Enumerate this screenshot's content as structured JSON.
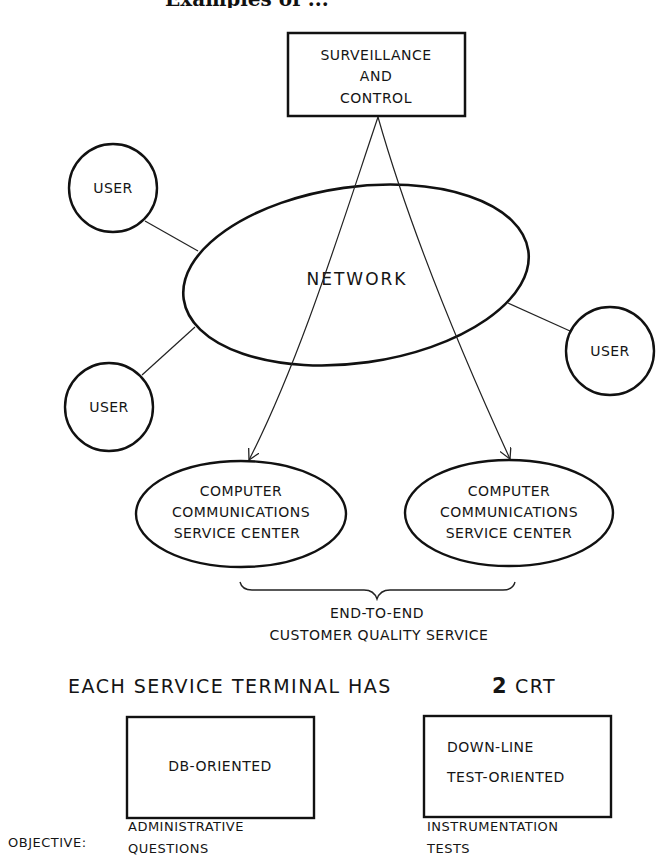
{
  "header": {
    "cut_off_title": "Examples of ..."
  },
  "diagram": {
    "surveillance_box": {
      "lines": [
        "SURVEILLANCE",
        "AND",
        "CONTROL"
      ]
    },
    "network": {
      "label": "NETWORK"
    },
    "users": [
      {
        "label": "USER",
        "position": "upper-left"
      },
      {
        "label": "USER",
        "position": "lower-left"
      },
      {
        "label": "USER",
        "position": "right"
      }
    ],
    "service_centers": [
      {
        "lines": [
          "COMPUTER",
          "COMMUNICATIONS",
          "SERVICE CENTER"
        ]
      },
      {
        "lines": [
          "COMPUTER",
          "COMMUNICATIONS",
          "SERVICE CENTER"
        ]
      }
    ],
    "brace_caption": {
      "lines": [
        "END-TO-END",
        "CUSTOMER QUALITY SERVICE"
      ]
    }
  },
  "terminal": {
    "heading": {
      "prefix": "EACH SERVICE TERMINAL HAS",
      "count": "2",
      "suffix": "CRT"
    },
    "crts": [
      {
        "lines": [
          "DB-ORIENTED"
        ],
        "objective": [
          "ADMINISTRATIVE",
          "QUESTIONS"
        ]
      },
      {
        "lines": [
          "DOWN-LINE",
          "TEST-ORIENTED"
        ],
        "objective": [
          "INSTRUMENTATION",
          "TESTS"
        ]
      }
    ],
    "objective_label": "OBJECTIVE:"
  },
  "colors": {
    "ink": "#111111",
    "paper": "#ffffff"
  }
}
